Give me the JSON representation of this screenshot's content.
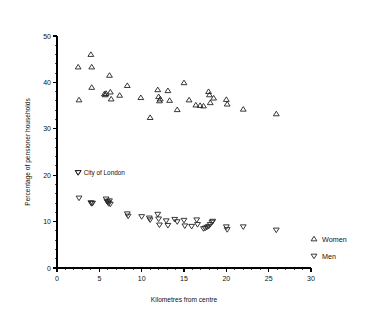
{
  "chart_data": {
    "type": "scatter",
    "title": "",
    "xlabel": "Kilometres from centre",
    "ylabel": "Percentage of pensioner households",
    "xlim": [
      0,
      30
    ],
    "ylim": [
      0,
      50
    ],
    "grid": false,
    "x_major_ticks": [
      0,
      5,
      10,
      15,
      20,
      25,
      30
    ],
    "x_tick_labels": [
      "0",
      "5",
      "10",
      "15",
      "20",
      "25",
      "30"
    ],
    "x_minor_step": 1,
    "y_major_ticks": [
      0,
      10,
      20,
      30,
      40,
      50
    ],
    "y_tick_labels": [
      "0",
      "10",
      "20",
      "30",
      "40",
      "50"
    ],
    "y_minor_step": 2,
    "legend_position": "right-bottom-outside",
    "series": [
      {
        "name": "Women",
        "marker": "triangle-up",
        "points": [
          [
            2.5,
            43.3
          ],
          [
            2.6,
            36.2
          ],
          [
            4.0,
            46.0
          ],
          [
            4.1,
            43.3
          ],
          [
            4.1,
            38.9
          ],
          [
            5.6,
            37.5
          ],
          [
            5.7,
            37.3
          ],
          [
            5.8,
            37.6
          ],
          [
            6.2,
            41.5
          ],
          [
            6.3,
            37.9
          ],
          [
            6.4,
            36.4
          ],
          [
            7.4,
            37.2
          ],
          [
            8.3,
            39.3
          ],
          [
            9.9,
            36.7
          ],
          [
            11.0,
            32.4
          ],
          [
            11.9,
            38.4
          ],
          [
            12.0,
            36.9
          ],
          [
            12.1,
            36.0
          ],
          [
            12.2,
            36.4
          ],
          [
            13.1,
            38.2
          ],
          [
            13.3,
            36.1
          ],
          [
            14.2,
            34.1
          ],
          [
            15.0,
            39.9
          ],
          [
            15.6,
            36.2
          ],
          [
            16.4,
            35.1
          ],
          [
            16.9,
            35.0
          ],
          [
            17.3,
            34.9
          ],
          [
            17.9,
            38.0
          ],
          [
            18.0,
            37.3
          ],
          [
            18.1,
            35.6
          ],
          [
            18.5,
            36.6
          ],
          [
            20.0,
            36.3
          ],
          [
            20.1,
            35.3
          ],
          [
            22.0,
            34.2
          ],
          [
            25.9,
            33.2
          ]
        ]
      },
      {
        "name": "Men",
        "marker": "triangle-down",
        "points": [
          [
            2.5,
            20.6
          ],
          [
            2.6,
            15.1
          ],
          [
            4.0,
            14.1
          ],
          [
            4.1,
            13.9
          ],
          [
            4.2,
            14.0
          ],
          [
            5.8,
            14.9
          ],
          [
            5.9,
            14.4
          ],
          [
            6.0,
            14.2
          ],
          [
            6.1,
            13.9
          ],
          [
            6.2,
            14.5
          ],
          [
            6.3,
            13.8
          ],
          [
            8.3,
            11.7
          ],
          [
            8.4,
            11.2
          ],
          [
            10.0,
            11.1
          ],
          [
            10.9,
            10.8
          ],
          [
            11.0,
            10.4
          ],
          [
            11.9,
            11.6
          ],
          [
            12.0,
            10.6
          ],
          [
            12.1,
            9.3
          ],
          [
            12.9,
            10.2
          ],
          [
            13.1,
            9.2
          ],
          [
            13.9,
            10.5
          ],
          [
            14.2,
            10.0
          ],
          [
            15.0,
            10.3
          ],
          [
            15.1,
            9.1
          ],
          [
            15.9,
            9.0
          ],
          [
            16.5,
            10.4
          ],
          [
            16.6,
            9.4
          ],
          [
            17.3,
            8.5
          ],
          [
            17.5,
            8.6
          ],
          [
            17.7,
            8.8
          ],
          [
            17.9,
            9.0
          ],
          [
            18.1,
            9.4
          ],
          [
            18.3,
            9.9
          ],
          [
            18.4,
            10.1
          ],
          [
            20.0,
            8.9
          ],
          [
            20.1,
            8.3
          ],
          [
            22.0,
            8.9
          ],
          [
            25.9,
            8.2
          ]
        ]
      }
    ],
    "annotations": [
      {
        "text": "City of London",
        "marker": "triangle-down",
        "x": 2.5,
        "y": 20.6
      }
    ]
  },
  "legend": {
    "entries": [
      {
        "label": "Women",
        "marker": "triangle-up"
      },
      {
        "label": "Men",
        "marker": "triangle-down"
      }
    ]
  }
}
